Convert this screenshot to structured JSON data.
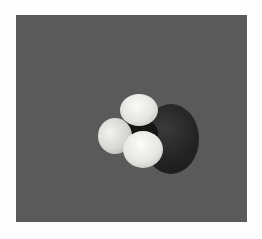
{
  "image": {
    "subject": "space-filling molecular model",
    "background_color": "#fdfdfd",
    "panel_color": "#5a5a5a",
    "atoms": [
      {
        "role": "central-large-atom",
        "color": "#232323"
      },
      {
        "role": "hydrogen-left",
        "color": "#e0e0dc"
      },
      {
        "role": "hydrogen-top",
        "color": "#ececea"
      },
      {
        "role": "hydrogen-front",
        "color": "#eeeeea"
      }
    ]
  }
}
